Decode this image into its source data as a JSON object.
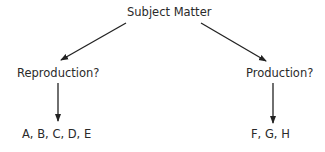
{
  "diagram": {
    "root": {
      "label": "Subject Matter"
    },
    "branches": [
      {
        "label": "Reproduction?",
        "result": "A, B, C, D, E"
      },
      {
        "label": "Production?",
        "result": "F, G, H"
      }
    ]
  }
}
